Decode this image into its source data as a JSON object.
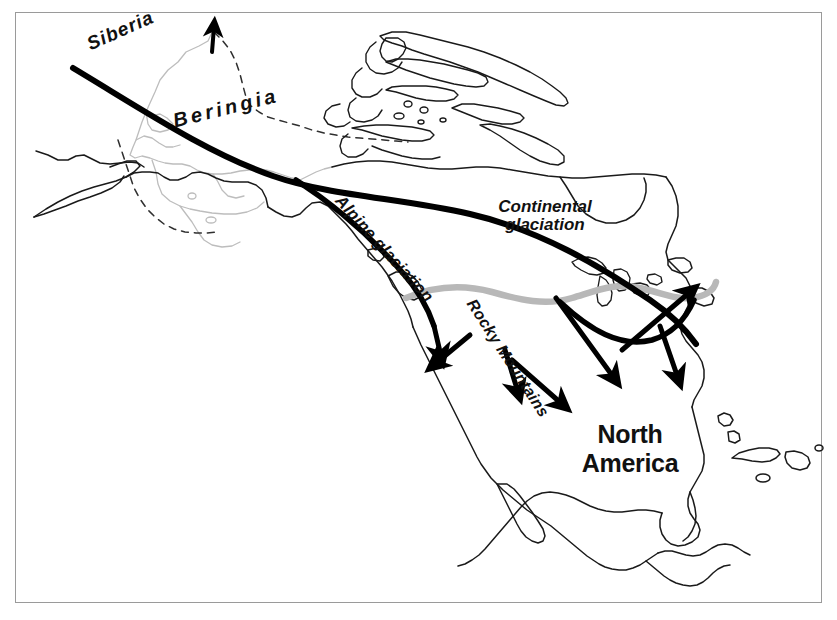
{
  "figure": {
    "type": "map",
    "width": 837,
    "height": 620
  },
  "frame": {
    "border_color": "#9a9a9a",
    "background": "#ffffff"
  },
  "palette": {
    "coastline": "#1a1a1a",
    "submerged_coastline": "#b9b9b9",
    "shelf_dashed": "#2b2b2b",
    "glacial_limit": "#000000",
    "ice_margin_gray": "#b8b8b8",
    "label": "#111111"
  },
  "labels": {
    "siberia": "Siberia",
    "beringia": "Beringia",
    "alpine_glaciation": "Alpine glaciation",
    "continental_glaciation": "Continental\nglaciation",
    "continental_glaciation_line1": "Continental",
    "continental_glaciation_line2": "glaciation",
    "rocky_mountains": "Rocky Mountains",
    "north_america": "North\nAmerica",
    "north_america_line1": "North",
    "north_america_line2": "America"
  },
  "map_features": {
    "glacial_limit_line": {
      "name": "southern limit of continental ice sheet",
      "style": "thick solid black curve",
      "stroke_width": 6
    },
    "ice_margin_line": {
      "name": "interior ice margin",
      "style": "thick light grey wavy line",
      "stroke_width": 6,
      "color": "#b8b8b8"
    },
    "beringia_shelf": {
      "name": "exposed continental shelf (Bering land bridge)",
      "style": "dashed outline"
    },
    "modern_coastline": {
      "name": "present-day coastline of Siberia and Alaska",
      "style": "thin light grey line"
    },
    "migration_arrows": {
      "count": 6,
      "description": "bold black arrows showing human migration routes southward and eastward from Beringia"
    }
  }
}
